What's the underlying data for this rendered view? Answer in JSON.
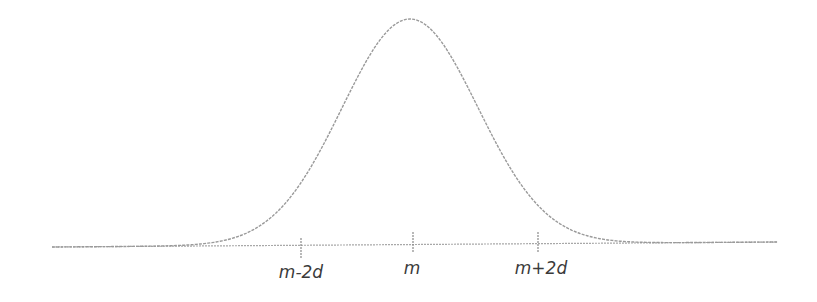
{
  "chart_data": {
    "type": "line",
    "title": "",
    "xlabel": "",
    "ylabel": "",
    "tick_labels": [
      "m-2d",
      "m",
      "m+2d"
    ],
    "tick_positions": [
      -2,
      0,
      2
    ],
    "mean_label": "m",
    "sd_label": "d",
    "grid": false,
    "legend": null,
    "curve": {
      "x": [
        -6,
        -5,
        -4,
        -3,
        -2.5,
        -2,
        -1.5,
        -1,
        -0.5,
        0,
        0.5,
        1,
        1.5,
        2,
        2.5,
        3,
        4,
        5,
        6
      ],
      "y": [
        0.0,
        0.0,
        0.0003,
        0.0111,
        0.0439,
        0.1353,
        0.3247,
        0.6065,
        0.8825,
        1.0,
        0.8825,
        0.6065,
        0.3247,
        0.1353,
        0.0439,
        0.0111,
        0.0003,
        0.0,
        0.0
      ]
    },
    "colors": {
      "curve": "#9a9a9a",
      "axis": "#a8a8a8",
      "ticks": "#8a8a8a",
      "labels": "#3a3a3a"
    }
  },
  "labels": {
    "left": "m-2d",
    "center": "m",
    "right": "m+2d"
  }
}
